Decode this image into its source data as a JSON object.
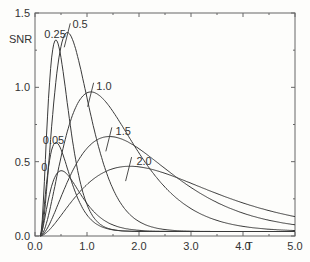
{
  "chart_data": {
    "type": "line",
    "title": "",
    "xlabel": "T",
    "ylabel": "SNR",
    "xlim": [
      0.0,
      5.0
    ],
    "ylim": [
      0.0,
      1.5
    ],
    "grid": false,
    "legend": "none (curves labeled inline)",
    "x_ticks": [
      "0.0",
      "1.0",
      "2.0",
      "3.0",
      "4.0",
      "5.0"
    ],
    "y_ticks": [
      "0.0",
      "0.5",
      "1.0",
      "1.5"
    ],
    "series": [
      {
        "name": "0",
        "peak_T": 0.5,
        "peak_SNR": 0.42,
        "label_pos": [
          0.12,
          0.44
        ]
      },
      {
        "name": "0.05",
        "peak_T": 0.4,
        "peak_SNR": 0.61,
        "label_pos": [
          0.15,
          0.62
        ]
      },
      {
        "name": "0.25",
        "peak_T": 0.4,
        "peak_SNR": 1.3,
        "label_pos": [
          0.18,
          1.33
        ]
      },
      {
        "name": "0.5",
        "peak_T": 0.62,
        "peak_SNR": 1.35,
        "label_pos": [
          0.72,
          1.4
        ]
      },
      {
        "name": "1.0",
        "peak_T": 1.07,
        "peak_SNR": 0.95,
        "label_pos": [
          1.18,
          0.98
        ]
      },
      {
        "name": "1.5",
        "peak_T": 1.42,
        "peak_SNR": 0.65,
        "label_pos": [
          1.55,
          0.68
        ]
      },
      {
        "name": "2.0",
        "peak_T": 1.8,
        "peak_SNR": 0.45,
        "label_pos": [
          1.95,
          0.48
        ]
      }
    ],
    "annotations": [
      "short tick marks across each curve near its peak for 0.5, 1.0, 1.5, 2.0"
    ]
  }
}
